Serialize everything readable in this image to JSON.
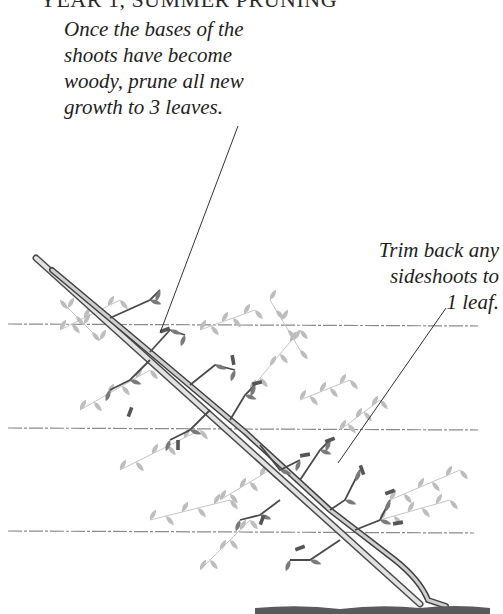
{
  "heading": {
    "text": "YEAR 1, SUMMER PRUNING"
  },
  "annotations": [
    {
      "id": "prune-new-growth",
      "lines": [
        "Once the bases of the",
        "shoots have become",
        "woody, prune all new",
        "growth to 3 leaves."
      ],
      "leader": {
        "x1": 238,
        "y1": 126,
        "x2": 160,
        "y2": 333
      }
    },
    {
      "id": "trim-sideshoots",
      "lines": [
        "Trim back any",
        "sideshoots to",
        "1 leaf."
      ],
      "leader": {
        "x1": 446,
        "y1": 308,
        "x2": 338,
        "y2": 463
      }
    }
  ],
  "illustration": {
    "subject": "diagonal cordon vine on training wires",
    "colors": {
      "wire": "#8a8a8a",
      "cane_outline": "#4a4a4a",
      "cane_fill": "#dcdcdc",
      "leaf_dark": "#7a7a7a",
      "leaf_light": "#bdbdbd",
      "stub": "#555555",
      "ground": "#5a5a5a",
      "leader": "#333333"
    },
    "wires": [
      {
        "x1": 8,
        "y1": 324,
        "x2": 478,
        "y2": 326
      },
      {
        "x1": 8,
        "y1": 428,
        "x2": 478,
        "y2": 430
      },
      {
        "x1": 8,
        "y1": 531,
        "x2": 474,
        "y2": 533
      }
    ],
    "cane": {
      "x1": 36,
      "y1": 258,
      "x2": 420,
      "y2": 604
    },
    "stem": {
      "x1": 52,
      "y1": 268,
      "x2": 440,
      "y2": 604
    },
    "ground": {
      "x1": 255,
      "y1": 608,
      "x2": 490,
      "y2": 608
    }
  }
}
